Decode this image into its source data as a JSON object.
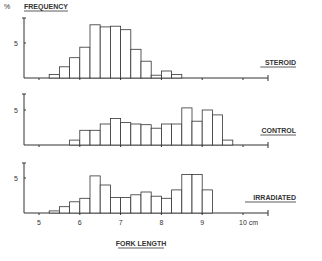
{
  "chart_data": [
    {
      "type": "bar",
      "title": "STEROID",
      "ylabel": "% FREQUENCY",
      "xlabel": "FORK LENGTH",
      "bin_width": 0.25,
      "x": [
        5.25,
        5.5,
        5.75,
        6.0,
        6.25,
        6.5,
        6.75,
        7.0,
        7.25,
        7.5,
        7.75,
        8.0,
        8.25
      ],
      "values": [
        0.5,
        1.6,
        2.9,
        4.4,
        7.6,
        7.3,
        7.4,
        6.9,
        4.1,
        2.4,
        0.4,
        1.0,
        0.5
      ],
      "ylim": [
        0,
        8
      ],
      "yticks": [
        5
      ]
    },
    {
      "type": "bar",
      "title": "CONTROL",
      "bin_width": 0.25,
      "x": [
        5.75,
        6.0,
        6.25,
        6.5,
        6.75,
        7.0,
        7.25,
        7.5,
        7.75,
        8.0,
        8.25,
        8.5,
        8.75,
        9.0,
        9.25,
        9.5
      ],
      "values": [
        0.7,
        2.1,
        2.1,
        3.0,
        3.8,
        3.2,
        3.0,
        2.9,
        2.4,
        3.0,
        3.0,
        5.3,
        3.4,
        5.0,
        4.3,
        0.7
      ],
      "ylim": [
        0,
        8
      ],
      "yticks": [
        5
      ]
    },
    {
      "type": "bar",
      "title": "IRRADIATED",
      "bin_width": 0.25,
      "x": [
        5.25,
        5.5,
        5.75,
        6.0,
        6.25,
        6.5,
        6.75,
        7.0,
        7.25,
        7.5,
        7.75,
        8.0,
        8.25,
        8.5,
        8.75,
        9.0
      ],
      "values": [
        0.3,
        0.9,
        1.6,
        2.1,
        5.3,
        4.0,
        2.2,
        2.2,
        2.6,
        3.0,
        2.4,
        2.1,
        3.3,
        5.5,
        5.5,
        3.3
      ],
      "ylim": [
        0,
        8
      ],
      "yticks": [
        5
      ]
    }
  ],
  "labels": {
    "y_axis": "% FREQUENCY",
    "y_prefix": "%",
    "y_title": "FREQUENCY",
    "x_axis": "FORK LENGTH",
    "panels": [
      "STEROID",
      "CONTROL",
      "IRRADIATED"
    ],
    "five": "5",
    "xticks": [
      "5",
      "6",
      "7",
      "8",
      "9",
      "10 cm"
    ]
  }
}
